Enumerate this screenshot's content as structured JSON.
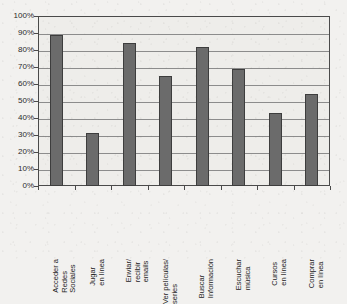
{
  "chart_data": {
    "type": "bar",
    "title": "",
    "subtitle": "",
    "xlabel": "",
    "ylabel": "",
    "ylim": [
      0,
      100
    ],
    "y_unit": "%",
    "grid": true,
    "legend": "none",
    "orientation": "vertical",
    "bar_color": "#6b6b6b",
    "bar_border_color": "#3d3d3d",
    "plot_background": "#eeedea",
    "page_background": "#f2f1ef",
    "axis_color": "#4a4a4a",
    "gridline_color": "#8c8c8c",
    "categories": [
      "Acceder a\nRedes\nSociales",
      "Jugar\nen línea",
      "Enviar/\nrecibir\nemails",
      "Ver películas/\nseries",
      "Buscar\nInformación",
      "Escuchar\nmúsica",
      "Cursos\nen línea",
      "Comprar\nen línea"
    ],
    "values": [
      89,
      31,
      84,
      65,
      82,
      69,
      43,
      54
    ],
    "ytick_labels": [
      "100%",
      "90%",
      "80%",
      "70%",
      "60%",
      "50%",
      "40%",
      "30%",
      "20%",
      "10%",
      "0%"
    ],
    "ytick_values": [
      100,
      90,
      80,
      70,
      60,
      50,
      40,
      30,
      20,
      10,
      0
    ]
  }
}
